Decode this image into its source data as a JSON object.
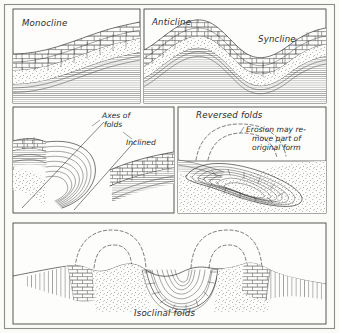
{
  "figure": {
    "background_color": "#fbfbf8",
    "ink_color": "#1f1f1f",
    "frame_color": "#8d8d8d"
  },
  "panels": [
    {
      "id": "monocline",
      "name": "monocline-panel",
      "labels": [
        {
          "text": "Monocline",
          "x": 22,
          "y": 26
        }
      ],
      "strata": [
        "limestone-brick",
        "sandstone-stipple",
        "shale-lines"
      ]
    },
    {
      "id": "anticline-syncline",
      "name": "anticline-syncline-panel",
      "labels": [
        {
          "text": "Anticline",
          "x": 152,
          "y": 25
        },
        {
          "text": "Syncline",
          "x": 258,
          "y": 42
        }
      ],
      "strata": [
        "limestone-brick",
        "sandstone-stipple",
        "shale-lines"
      ]
    },
    {
      "id": "axes-of-folds",
      "name": "axes-of-folds-panel",
      "labels": [
        {
          "text": "Axes of",
          "x": 102,
          "y": 118
        },
        {
          "text": "folds",
          "x": 104,
          "y": 127
        },
        {
          "text": "Inclined",
          "x": 126,
          "y": 145
        }
      ],
      "strata": [
        "limestone-brick",
        "sandstone-stipple",
        "shale-lines"
      ]
    },
    {
      "id": "reversed-folds",
      "name": "reversed-folds-panel",
      "labels": [
        {
          "text": "Reversed folds",
          "x": 196,
          "y": 118
        },
        {
          "text": "Erosion may re-",
          "x": 246,
          "y": 132
        },
        {
          "text": "move part of",
          "x": 252,
          "y": 141
        },
        {
          "text": "original form",
          "x": 252,
          "y": 150
        }
      ],
      "strata": [
        "limestone-brick",
        "sandstone-stipple",
        "shale-lines"
      ]
    },
    {
      "id": "isoclinal-folds",
      "name": "isoclinal-folds-panel",
      "labels": [
        {
          "text": "Isoclinal folds",
          "x": 134,
          "y": 316
        }
      ],
      "strata": [
        "limestone-brick",
        "sandstone-stipple",
        "shale-lines"
      ]
    }
  ]
}
